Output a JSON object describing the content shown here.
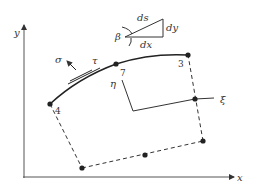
{
  "diagram": {
    "axes": {
      "x_label": "x",
      "y_label": "y"
    },
    "stresses": {
      "normal": "σ",
      "shear": "τ"
    },
    "nodes": [
      {
        "id": "4",
        "label": "4"
      },
      {
        "id": "7",
        "label": "7"
      },
      {
        "id": "3",
        "label": "3"
      }
    ],
    "local_axes": {
      "xi": "ξ",
      "eta": "η"
    },
    "differential_triangle": {
      "angle": "β",
      "hypotenuse": "ds",
      "vertical": "dy",
      "horizontal": "dx"
    },
    "colors": {
      "line": "#333333",
      "background": "#ffffff"
    }
  }
}
